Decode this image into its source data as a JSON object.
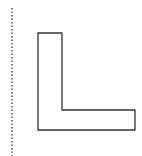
{
  "canvas": {
    "width": 142,
    "height": 156,
    "background": "#ffffff"
  },
  "guide_line": {
    "x": 12,
    "y1": 8,
    "y2": 156,
    "color": "#555555",
    "style": "dotted"
  },
  "shape": {
    "type": "L-shape",
    "points": "38,33 62,33 62,110 135,110 135,130 38,130",
    "stroke": "#333333",
    "fill": "#ffffff",
    "stroke_width": 1.3
  }
}
